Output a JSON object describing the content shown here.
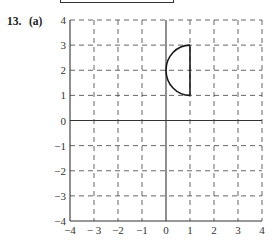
{
  "problem": {
    "number": "13.",
    "part": "(a)"
  },
  "chart_data": {
    "type": "line",
    "title": "",
    "xlabel": "",
    "ylabel": "",
    "xlim": [
      -4,
      4
    ],
    "ylim": [
      -4,
      4
    ],
    "grid": true,
    "grid_style": "dashed",
    "x_ticks": [
      -4,
      -3,
      -2,
      -1,
      0,
      1,
      2,
      3,
      4
    ],
    "y_ticks": [
      -4,
      -3,
      -2,
      -1,
      0,
      1,
      2,
      3,
      4
    ],
    "x_tick_labels": [
      "−4",
      "− 3",
      "−2",
      "−1",
      "0",
      "1",
      "2",
      "3",
      "4"
    ],
    "y_tick_labels": [
      "−4",
      "−3",
      "−2",
      "−1",
      "0",
      "1",
      "2",
      "3",
      "4"
    ],
    "series": [
      {
        "name": "left semicircle",
        "kind": "arc",
        "center": [
          1,
          2
        ],
        "radius": 1,
        "from_point": [
          1,
          3
        ],
        "to_point": [
          1,
          1
        ],
        "side": "left"
      },
      {
        "name": "vertical segment",
        "kind": "segment",
        "points": [
          [
            1,
            1
          ],
          [
            1,
            3
          ]
        ]
      }
    ],
    "colors": {
      "curve": "#1a1a1a",
      "grid": "#555555",
      "axis": "#333333"
    }
  }
}
